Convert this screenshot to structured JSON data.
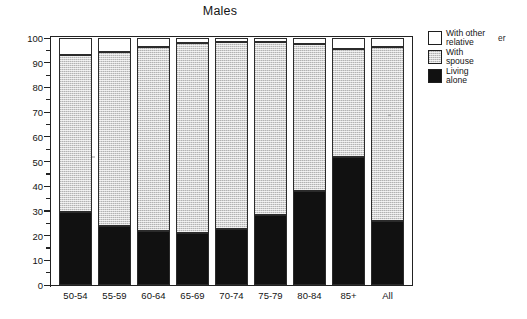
{
  "chart_data": {
    "type": "bar",
    "stacked": true,
    "title": "Males",
    "xlabel": "",
    "ylabel": "",
    "ylim": [
      0,
      100
    ],
    "ytick_step": 10,
    "yminor_step": 5,
    "grid": false,
    "legend_position": "right",
    "categories": [
      "50-54",
      "55-59",
      "60-64",
      "65-69",
      "70-74",
      "75-79",
      "80-84",
      "85+",
      "All"
    ],
    "ytick_labels": [
      "0",
      "10",
      "20",
      "30",
      "40",
      "50",
      "60",
      "70",
      "80",
      "90",
      "100"
    ],
    "series": [
      {
        "name": "Living alone",
        "color": "#111111",
        "values": [
          29.5,
          24.0,
          22.0,
          21.0,
          22.5,
          28.5,
          38.0,
          52.0,
          26.0
        ]
      },
      {
        "name": "With spouse",
        "color": "#d2d2d2",
        "values": [
          63.5,
          70.5,
          74.5,
          77.0,
          76.0,
          70.0,
          59.5,
          43.5,
          70.5
        ]
      },
      {
        "name": "With other relative",
        "color": "#ffffff",
        "values": [
          7.0,
          5.5,
          3.5,
          2.0,
          1.5,
          1.5,
          2.5,
          4.5,
          3.5
        ]
      }
    ],
    "cumulative_tops": {
      "living_alone": [
        29.5,
        24.0,
        22.0,
        21.0,
        22.5,
        28.5,
        38.0,
        52.0,
        26.0
      ],
      "with_spouse": [
        93.0,
        94.5,
        96.5,
        98.0,
        98.5,
        98.5,
        97.5,
        95.5,
        96.5
      ],
      "with_other_relative": [
        100,
        100,
        100,
        100,
        100,
        100,
        100,
        100,
        100
      ]
    }
  },
  "legend": {
    "items": [
      {
        "label": "With other\nrelative",
        "swatch": "other"
      },
      {
        "label": "With\nspouse",
        "swatch": "spouse"
      },
      {
        "label": "Living\nalone",
        "swatch": "alone"
      }
    ],
    "stray_text": "er"
  }
}
